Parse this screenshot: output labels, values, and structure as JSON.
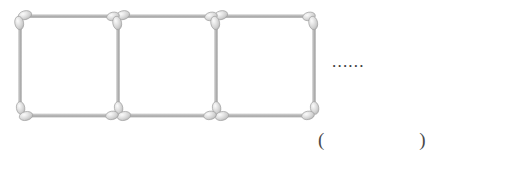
{
  "figure": {
    "name": "matchstick-square-sequence",
    "description_label": "matchstick-figure",
    "squares_shown": 3,
    "ellipsis": "......",
    "answer_blank": "(                    )",
    "colors": {
      "stick_shaft": "#b4b4b4",
      "stick_shaft_light": "#e4e4e4",
      "stick_shaft_dark": "#9a9a9a",
      "head_fill": "#d9d9d9",
      "head_highlight": "#f2f2f2",
      "head_outline": "#9e9e9e",
      "text": "#3a3a3a",
      "background": "#ffffff"
    },
    "geometry": {
      "columns_x": [
        20,
        118,
        216,
        314
      ],
      "top_y": 16,
      "bottom_y": 115,
      "stick_length_horizontal": 98,
      "stick_length_vertical": 99,
      "shaft_thickness": 4,
      "head_width": 9,
      "head_height": 14
    },
    "sticks": {
      "top_horizontal": [
        {
          "name": "top-stick-1",
          "x1": 20,
          "x2": 118,
          "y": 16
        },
        {
          "name": "top-stick-2",
          "x1": 118,
          "x2": 216,
          "y": 16
        },
        {
          "name": "top-stick-3",
          "x1": 216,
          "x2": 314,
          "y": 16
        }
      ],
      "bottom_horizontal": [
        {
          "name": "bottom-stick-1",
          "x1": 20,
          "x2": 118,
          "y": 115
        },
        {
          "name": "bottom-stick-2",
          "x1": 118,
          "x2": 216,
          "y": 115
        },
        {
          "name": "bottom-stick-3",
          "x1": 216,
          "x2": 314,
          "y": 115
        }
      ],
      "vertical": [
        {
          "name": "vertical-stick-1",
          "x": 20,
          "y1": 16,
          "y2": 115
        },
        {
          "name": "vertical-stick-2",
          "x": 118,
          "y1": 16,
          "y2": 115
        },
        {
          "name": "vertical-stick-3",
          "x": 216,
          "y1": 16,
          "y2": 115
        },
        {
          "name": "vertical-stick-4",
          "x": 314,
          "y1": 16,
          "y2": 115
        }
      ]
    }
  }
}
